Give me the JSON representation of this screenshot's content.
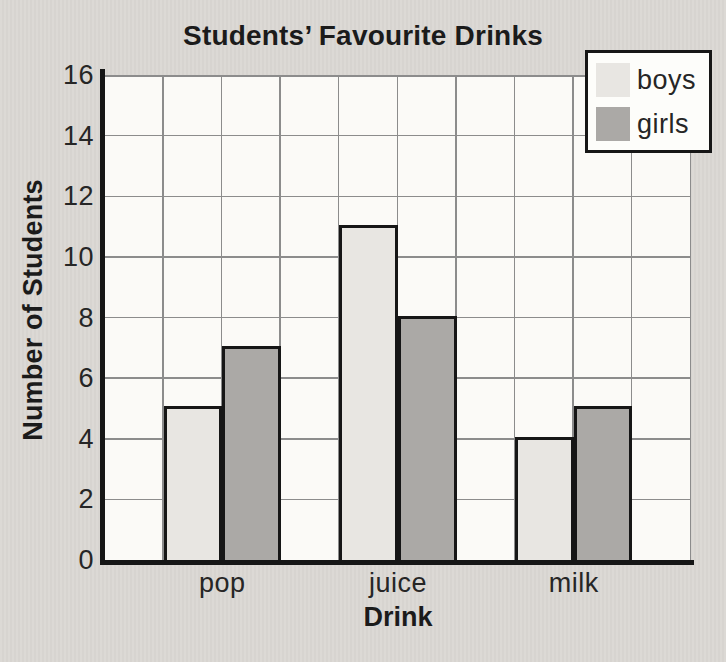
{
  "chart_data": {
    "type": "bar",
    "categories": [
      "pop",
      "juice",
      "milk"
    ],
    "series": [
      {
        "name": "boys",
        "values": [
          5,
          11,
          4
        ],
        "color": "#e8e6e2"
      },
      {
        "name": "girls",
        "values": [
          7,
          8,
          5
        ],
        "color": "#aba9a6"
      }
    ],
    "title": "Students’ Favourite Drinks",
    "xlabel": "Drink",
    "ylabel": "Number of Students",
    "ylim": [
      0,
      16
    ],
    "yticks": [
      0,
      2,
      4,
      6,
      8,
      10,
      12,
      14,
      16
    ],
    "grid": true,
    "legend_position": "top-right"
  },
  "colors": {
    "background": "#dad7d3",
    "plot_background": "#fbfaf7",
    "boys": "#e8e6e2",
    "girls": "#aba9a6",
    "axis": "#161616",
    "gridline": "#8c8c8c",
    "text": "#1b1b1b"
  }
}
